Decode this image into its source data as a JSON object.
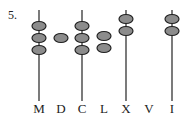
{
  "problem_number": "5.",
  "rods": [
    {
      "label": "M",
      "x": 39,
      "has_rod": true,
      "beads": 3
    },
    {
      "label": "D",
      "x": 61,
      "has_rod": false,
      "beads": 1
    },
    {
      "label": "C",
      "x": 82,
      "has_rod": true,
      "beads": 3
    },
    {
      "label": "L",
      "x": 104,
      "has_rod": false,
      "beads": 2
    },
    {
      "label": "X",
      "x": 126,
      "has_rod": true,
      "beads": 2
    },
    {
      "label": "V",
      "x": 149,
      "has_rod": false,
      "beads": 0
    },
    {
      "label": "I",
      "x": 172,
      "has_rod": true,
      "beads": 2
    }
  ],
  "colors": {
    "bead_fill": "#8c8c8c",
    "bead_stroke": "#222222",
    "rod": "#333333"
  }
}
